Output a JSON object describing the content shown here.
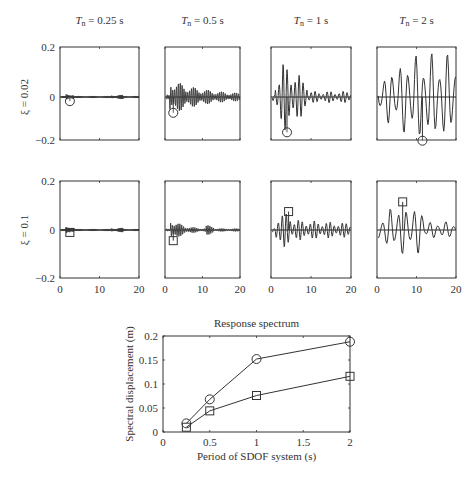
{
  "chart_data": [
    {
      "type": "line",
      "title": "Displacement time histories of SDOF systems",
      "grid_rows": [
        {
          "label": "ξ = 0.02",
          "damping": 0.02,
          "marker": "circle"
        },
        {
          "label": "ξ = 0.1",
          "damping": 0.1,
          "marker": "square"
        }
      ],
      "grid_cols": [
        {
          "label": "Tn = 0.25 s",
          "period": 0.25
        },
        {
          "label": "Tn = 0.5 s",
          "period": 0.5
        },
        {
          "label": "Tn = 1 s",
          "period": 1
        },
        {
          "label": "Tn = 2 s",
          "period": 2
        }
      ],
      "xlim": [
        0,
        20
      ],
      "ylim": [
        -0.2,
        0.2
      ],
      "xticks": [
        "0",
        "10",
        "20"
      ],
      "yticks": [
        "0.2",
        "0",
        "-0.2"
      ],
      "peaks": [
        {
          "row": 0,
          "col": 0,
          "t": 2.5,
          "u": -0.018
        },
        {
          "row": 0,
          "col": 1,
          "t": 2.2,
          "u": -0.068
        },
        {
          "row": 0,
          "col": 2,
          "t": 4.0,
          "u": -0.152
        },
        {
          "row": 0,
          "col": 3,
          "t": 11.5,
          "u": -0.188
        },
        {
          "row": 1,
          "col": 0,
          "t": 2.5,
          "u": -0.01
        },
        {
          "row": 1,
          "col": 1,
          "t": 2.2,
          "u": -0.044
        },
        {
          "row": 1,
          "col": 2,
          "t": 4.4,
          "u": 0.076
        },
        {
          "row": 1,
          "col": 3,
          "t": 6.5,
          "u": 0.116
        }
      ]
    },
    {
      "type": "line",
      "title": "Response spectrum",
      "xlabel": "Period of SDOF system (s)",
      "ylabel": "Spectral displacement (m)",
      "x": [
        0.25,
        0.5,
        1,
        2
      ],
      "xlim": [
        0,
        2
      ],
      "ylim": [
        0,
        0.2
      ],
      "xticks": [
        "0",
        "0.5",
        "1",
        "1.5",
        "2"
      ],
      "yticks": [
        "0",
        "0.05",
        "0.1",
        "0.15",
        "0.2"
      ],
      "grid": false,
      "series": [
        {
          "name": "ξ = 0.02",
          "marker": "circle",
          "values": [
            0.018,
            0.068,
            0.152,
            0.188
          ]
        },
        {
          "name": "ξ = 0.1",
          "marker": "square",
          "values": [
            0.01,
            0.044,
            0.076,
            0.116
          ]
        }
      ]
    }
  ],
  "labels": {
    "col_titles": [
      {
        "T": "T",
        "sub": "n",
        "rest": " = 0.25 s"
      },
      {
        "T": "T",
        "sub": "n",
        "rest": " = 0.5 s"
      },
      {
        "T": "T",
        "sub": "n",
        "rest": " = 1 s"
      },
      {
        "T": "T",
        "sub": "n",
        "rest": " = 2 s"
      }
    ],
    "row_labels": [
      "ξ = 0.02",
      "ξ = 0.1"
    ],
    "spectrum_title": "Response spectrum",
    "spectrum_xlabel": "Period of SDOF system (s)",
    "spectrum_ylabel": "Spectral displacement (m)"
  }
}
